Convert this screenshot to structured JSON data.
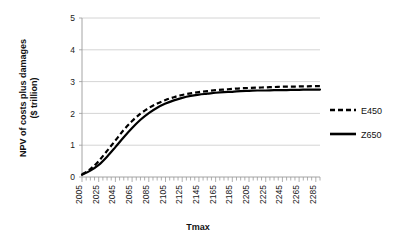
{
  "chart_data": {
    "type": "line",
    "title": "",
    "xlabel": "Tmax",
    "ylabel": "NPV of costs plus damages ($ trillion)",
    "ylabel_line1": "NPV of costs plus damages",
    "ylabel_line2": "($ trillion)",
    "ylim": [
      0,
      5
    ],
    "xlim": [
      2005,
      2290
    ],
    "ytick_labels": [
      "5",
      "4",
      "3",
      "2",
      "1",
      "0"
    ],
    "ytick_values": [
      5,
      4,
      3,
      2,
      1,
      0
    ],
    "xtick_labels": [
      "2005",
      "2025",
      "2045",
      "2065",
      "2085",
      "2105",
      "2125",
      "2145",
      "2165",
      "2185",
      "2205",
      "2225",
      "2245",
      "2265",
      "2285"
    ],
    "xtick_values": [
      2005,
      2025,
      2045,
      2065,
      2085,
      2105,
      2125,
      2145,
      2165,
      2185,
      2205,
      2225,
      2245,
      2265,
      2285
    ],
    "minor_tick_step": 5,
    "grid": "horizontal",
    "legend_position": "right",
    "x": [
      2005,
      2015,
      2025,
      2035,
      2045,
      2055,
      2065,
      2075,
      2085,
      2095,
      2105,
      2115,
      2125,
      2135,
      2145,
      2155,
      2165,
      2175,
      2185,
      2195,
      2205,
      2215,
      2225,
      2235,
      2245,
      2255,
      2265,
      2275,
      2285,
      2290
    ],
    "series": [
      {
        "name": "E450",
        "style": "dashed",
        "color": "#000000",
        "values": [
          0.08,
          0.25,
          0.5,
          0.82,
          1.15,
          1.48,
          1.76,
          1.99,
          2.17,
          2.31,
          2.42,
          2.51,
          2.58,
          2.63,
          2.67,
          2.7,
          2.73,
          2.75,
          2.77,
          2.79,
          2.8,
          2.81,
          2.82,
          2.83,
          2.84,
          2.84,
          2.85,
          2.85,
          2.86,
          2.86
        ]
      },
      {
        "name": "Z650",
        "style": "solid",
        "color": "#000000",
        "values": [
          0.07,
          0.2,
          0.38,
          0.64,
          0.94,
          1.25,
          1.54,
          1.8,
          2.01,
          2.18,
          2.31,
          2.41,
          2.49,
          2.55,
          2.59,
          2.62,
          2.65,
          2.67,
          2.68,
          2.7,
          2.71,
          2.72,
          2.72,
          2.73,
          2.73,
          2.74,
          2.74,
          2.75,
          2.75,
          2.75
        ]
      }
    ]
  },
  "legend": {
    "entries": [
      {
        "label": "E450",
        "style": "dashed"
      },
      {
        "label": "Z650",
        "style": "solid"
      }
    ]
  }
}
